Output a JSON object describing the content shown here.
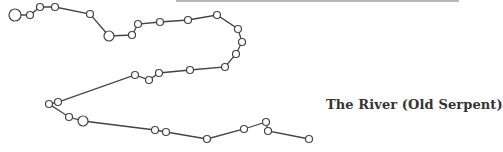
{
  "diagram": {
    "title": "The River (Old Serpent)",
    "colors": {
      "line": "#444444",
      "node_stroke": "#444444",
      "node_fill": "#ffffff",
      "label": "#333333",
      "top_rule": "#b8b8b8"
    },
    "nodes": [
      {
        "x": 15,
        "y": 15,
        "r": 6
      },
      {
        "x": 30,
        "y": 15,
        "r": 3.5
      },
      {
        "x": 40,
        "y": 7,
        "r": 3.5
      },
      {
        "x": 55,
        "y": 7,
        "r": 3.5
      },
      {
        "x": 90,
        "y": 14,
        "r": 3.5
      },
      {
        "x": 109,
        "y": 36,
        "r": 5
      },
      {
        "x": 132,
        "y": 35,
        "r": 3.5
      },
      {
        "x": 138,
        "y": 24,
        "r": 3.5
      },
      {
        "x": 160,
        "y": 22,
        "r": 3.5
      },
      {
        "x": 188,
        "y": 20,
        "r": 3.5
      },
      {
        "x": 217,
        "y": 15,
        "r": 3.5
      },
      {
        "x": 238,
        "y": 29,
        "r": 3.5
      },
      {
        "x": 242,
        "y": 42,
        "r": 3.5
      },
      {
        "x": 236,
        "y": 54,
        "r": 3.5
      },
      {
        "x": 225,
        "y": 67,
        "r": 3.5
      },
      {
        "x": 190,
        "y": 70,
        "r": 3.5
      },
      {
        "x": 159,
        "y": 73,
        "r": 3.5
      },
      {
        "x": 149,
        "y": 80,
        "r": 3.5
      },
      {
        "x": 135,
        "y": 75,
        "r": 3.5
      },
      {
        "x": 58,
        "y": 102,
        "r": 3.5
      },
      {
        "x": 49,
        "y": 104,
        "r": 3.5
      },
      {
        "x": 69,
        "y": 117,
        "r": 3.5
      },
      {
        "x": 83,
        "y": 121,
        "r": 5
      },
      {
        "x": 155,
        "y": 130,
        "r": 3.5
      },
      {
        "x": 166,
        "y": 132,
        "r": 3.5
      },
      {
        "x": 207,
        "y": 139,
        "r": 3.5
      },
      {
        "x": 244,
        "y": 129,
        "r": 3.5
      },
      {
        "x": 266,
        "y": 122,
        "r": 3.5
      },
      {
        "x": 268,
        "y": 131,
        "r": 3.5
      },
      {
        "x": 309,
        "y": 139,
        "r": 3.5
      }
    ]
  }
}
